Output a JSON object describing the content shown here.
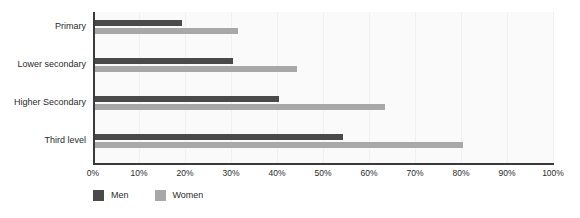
{
  "chart_data": {
    "type": "bar",
    "orientation": "horizontal",
    "title": "",
    "subtitle": "",
    "xlabel": "",
    "ylabel": "",
    "categories": [
      "Primary",
      "Lower secondary",
      "Higher Secondary",
      "Third level"
    ],
    "series": [
      {
        "name": "Men",
        "color": "#4a4a4a",
        "values": [
          19,
          30,
          40,
          54
        ]
      },
      {
        "name": "Women",
        "color": "#a8a8a8",
        "values": [
          31,
          44,
          63,
          80
        ]
      }
    ],
    "xlim": [
      0,
      100
    ],
    "xticks": [
      0,
      10,
      20,
      30,
      40,
      50,
      60,
      70,
      80,
      90,
      100
    ],
    "xtick_labels": [
      "0%",
      "10%",
      "20%",
      "30%",
      "40%",
      "50%",
      "60%",
      "70%",
      "80%",
      "90%",
      "100%"
    ],
    "value_suffix": "%",
    "grid": "vertical-faint",
    "legend_position": "bottom-left",
    "plot_background": "#fafafa",
    "axis_color": "#3a3a3a",
    "gridline_color": "#f0f0f0",
    "text_color": "#2b2b2b"
  }
}
